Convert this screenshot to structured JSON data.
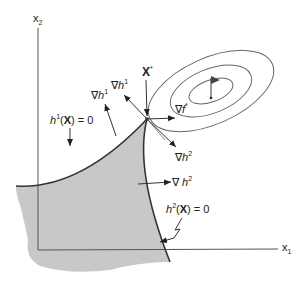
{
  "diagram": {
    "type": "constrained-optimization-contour",
    "axes": {
      "x_label": "x",
      "x_sub": "1",
      "y_label": "x",
      "y_sub": "2"
    },
    "optimum_point": {
      "label": "X",
      "sup": "*"
    },
    "gradients": {
      "grad_f": {
        "nabla": "∇",
        "var": "f",
        "sup": "*"
      },
      "grad_h1_a": {
        "nabla": "∇",
        "var": "h",
        "sup": "1"
      },
      "grad_h1_b": {
        "nabla": "∇",
        "var": "h",
        "sup": "1"
      },
      "grad_h2_a": {
        "nabla": "∇",
        "var": "h",
        "sup": "2"
      },
      "grad_h2_b": {
        "nabla": "∇ ",
        "var": "h",
        "sup": "2"
      }
    },
    "constraints": {
      "h1": {
        "var": "h",
        "sup": "1",
        "arg": "(",
        "bold": "X",
        "rest": ") = 0"
      },
      "h2": {
        "var": "h",
        "sup": "2",
        "arg": "(",
        "bold": "X",
        "rest": ") = 0"
      }
    },
    "colors": {
      "feasible_fill": "#c8c8c8",
      "line": "#333333",
      "contour": "#666666"
    }
  }
}
